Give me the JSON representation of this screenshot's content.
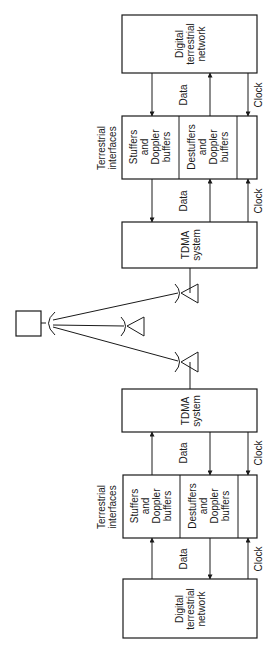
{
  "diagram": {
    "top_station": {
      "network": {
        "line1": "Digital",
        "line2": "terrestrial",
        "line3": "network"
      },
      "link_net_if": {
        "data": "Data",
        "clock": "Clock"
      },
      "interfaces_label": {
        "line1": "Terrestrial",
        "line2": "interfaces"
      },
      "stuffers": {
        "line1": "Stuffers",
        "line2": "and",
        "line3": "Doppler",
        "line4": "buffers"
      },
      "destuffers": {
        "line1": "Destuffers",
        "line2": "and",
        "line3": "Doppler",
        "line4": "buffers"
      },
      "link_if_tdma": {
        "data": "Data",
        "clock": "Clock"
      },
      "tdma": {
        "line1": "TDMA",
        "line2": "system"
      }
    },
    "satellite": {
      "icon": "satellite-icon"
    },
    "bottom_station": {
      "tdma": {
        "line1": "TDMA",
        "line2": "system"
      },
      "link_tdma_if": {
        "data": "Data",
        "clock": "Clock"
      },
      "interfaces_label": {
        "line1": "Terrestrial",
        "line2": "interfaces"
      },
      "stuffers": {
        "line1": "Stuffers",
        "line2": "and",
        "line3": "Doppler",
        "line4": "buffers"
      },
      "destuffers": {
        "line1": "Destuffers",
        "line2": "and",
        "line3": "Doppler",
        "line4": "buffers"
      },
      "link_if_net": {
        "data": "Data",
        "clock": "Clock"
      },
      "network": {
        "line1": "Digital",
        "line2": "terrestrial",
        "line3": "network"
      }
    },
    "colors": {
      "ink": "#1a1a1a",
      "background": "#ffffff"
    }
  }
}
